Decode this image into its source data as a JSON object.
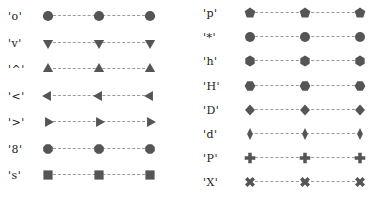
{
  "figure": {
    "kind": "marker-style-reference",
    "background_color": "#ffffff",
    "marker_color": "#555555",
    "line_color": "#9a9a9a",
    "line_style": "dashed",
    "text_color": "#1a1a1a",
    "points_per_row": 3
  },
  "chart_data": {
    "type": "scatter",
    "title": "",
    "xlabel": "",
    "ylabel": "",
    "grid": false,
    "legend_position": "none",
    "axes_visible": false,
    "x": [
      0,
      1,
      2
    ],
    "columns": [
      {
        "name": "left-column",
        "series": [
          {
            "name": "circle",
            "label": "'o'",
            "marker": "o",
            "marker_shape": "circle",
            "values": [
              0,
              0,
              0
            ]
          },
          {
            "name": "triangle-down",
            "label": "'v'",
            "marker": "v",
            "marker_shape": "triangle-down",
            "values": [
              0,
              0,
              0
            ]
          },
          {
            "name": "triangle-up",
            "label": "'^'",
            "marker": "^",
            "marker_shape": "triangle-up",
            "values": [
              0,
              0,
              0
            ]
          },
          {
            "name": "triangle-left",
            "label": "'<'",
            "marker": "<",
            "marker_shape": "triangle-left",
            "values": [
              0,
              0,
              0
            ]
          },
          {
            "name": "triangle-right",
            "label": "'>'",
            "marker": ">",
            "marker_shape": "triangle-right",
            "values": [
              0,
              0,
              0
            ]
          },
          {
            "name": "octagon",
            "label": "'8'",
            "marker": "8",
            "marker_shape": "octagon",
            "values": [
              0,
              0,
              0
            ]
          },
          {
            "name": "square",
            "label": "'s'",
            "marker": "s",
            "marker_shape": "square",
            "values": [
              0,
              0,
              0
            ]
          }
        ]
      },
      {
        "name": "right-column",
        "series": [
          {
            "name": "pentagon",
            "label": "'p'",
            "marker": "p",
            "marker_shape": "pentagon",
            "values": [
              0,
              0,
              0
            ]
          },
          {
            "name": "star",
            "label": "'*'",
            "marker": "*",
            "marker_shape": "star",
            "values": [
              0,
              0,
              0
            ]
          },
          {
            "name": "hexagon1",
            "label": "'h'",
            "marker": "h",
            "marker_shape": "hexagon-pointy",
            "values": [
              0,
              0,
              0
            ]
          },
          {
            "name": "hexagon2",
            "label": "'H'",
            "marker": "H",
            "marker_shape": "hexagon-flat",
            "values": [
              0,
              0,
              0
            ]
          },
          {
            "name": "diamond",
            "label": "'D'",
            "marker": "D",
            "marker_shape": "diamond",
            "values": [
              0,
              0,
              0
            ]
          },
          {
            "name": "thin-diamond",
            "label": "'d'",
            "marker": "d",
            "marker_shape": "thin-diamond",
            "values": [
              0,
              0,
              0
            ]
          },
          {
            "name": "plus-filled",
            "label": "'P'",
            "marker": "P",
            "marker_shape": "plus-filled",
            "values": [
              0,
              0,
              0
            ]
          },
          {
            "name": "x-filled",
            "label": "'X'",
            "marker": "X",
            "marker_shape": "x-filled",
            "values": [
              0,
              0,
              0
            ]
          }
        ]
      }
    ]
  }
}
